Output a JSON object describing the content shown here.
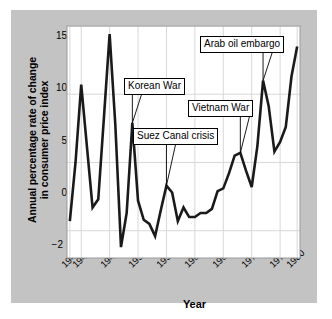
{
  "figure": {
    "panel_background": "#c3c3c3",
    "plot_background": "#ffffff",
    "line_color": "#1a1a1a",
    "grid_color": "#d8d8d8"
  },
  "chart_data": {
    "type": "line",
    "title": "",
    "xlabel": "Year",
    "ylabel": "Annual percentage rate of change in consumer price index",
    "ylabel_line1": "Annual percentage rate of change",
    "ylabel_line2": "in consumer price index",
    "xlim": [
      1939.5,
      1980.5
    ],
    "ylim": [
      -2,
      15
    ],
    "yticks": [
      -2,
      0,
      5,
      10,
      15
    ],
    "ytick_labels": [
      "−2",
      "0",
      "5",
      "10",
      "15"
    ],
    "xticks": [
      1940,
      1942,
      1947,
      1952,
      1957,
      1962,
      1967,
      1972,
      1977,
      1980
    ],
    "xtick_labels": [
      "1940",
      "1942",
      "1947",
      "1952",
      "1957",
      "1962",
      "1967",
      "1972",
      "1977",
      "1980"
    ],
    "grid": true,
    "legend": "none",
    "x": [
      1940,
      1941,
      1942,
      1943,
      1944,
      1945,
      1946,
      1947,
      1948,
      1949,
      1950,
      1951,
      1952,
      1953,
      1954,
      1955,
      1956,
      1957,
      1958,
      1959,
      1960,
      1961,
      1962,
      1963,
      1964,
      1965,
      1966,
      1967,
      1968,
      1969,
      1970,
      1971,
      1972,
      1973,
      1974,
      1975,
      1976,
      1977,
      1978,
      1979,
      1980
    ],
    "values": [
      0.7,
      5.0,
      10.7,
      6.2,
      1.7,
      2.3,
      8.3,
      14.4,
      7.8,
      -1.2,
      1.3,
      7.9,
      2.2,
      0.8,
      0.5,
      -0.4,
      1.5,
      3.3,
      2.8,
      0.7,
      1.7,
      1.0,
      1.0,
      1.3,
      1.3,
      1.6,
      2.9,
      3.1,
      4.2,
      5.5,
      5.7,
      4.4,
      3.2,
      6.2,
      11.0,
      9.1,
      5.8,
      6.5,
      7.6,
      11.3,
      13.5
    ],
    "annotations": [
      {
        "name": "korean-war",
        "label": "Korean War",
        "points_to_year": 1951,
        "points_to_value": 7.9
      },
      {
        "name": "suez-canal-crisis",
        "label": "Suez Canal crisis",
        "points_to_year": 1957,
        "points_to_value": 3.3
      },
      {
        "name": "vietnam-war",
        "label": "Vietnam War",
        "points_to_year": 1970,
        "points_to_value": 5.7
      },
      {
        "name": "arab-oil-embargo",
        "label": "Arab oil embargo",
        "points_to_year": 1974,
        "points_to_value": 11.0
      }
    ]
  }
}
